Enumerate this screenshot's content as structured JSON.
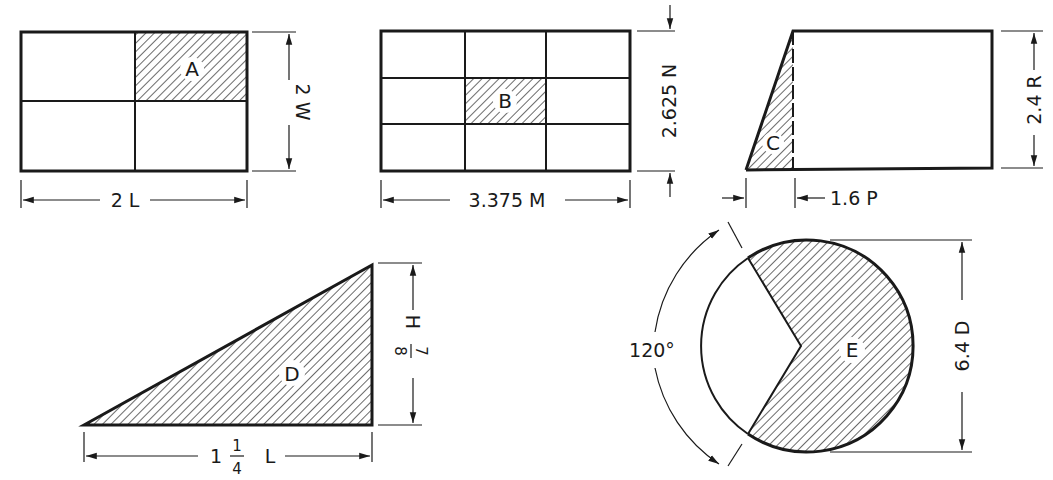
{
  "figures": {
    "A": {
      "label": "A",
      "width_dim": "2 L",
      "height_dim": "2 W",
      "grid": "2x2",
      "shaded_cell": "top-right"
    },
    "B": {
      "label": "B",
      "width_dim": "3.375 M",
      "height_dim": "2.625 N",
      "grid": "3x3",
      "shaded_cell": "center"
    },
    "C": {
      "label": "C",
      "offset_dim": "1.6 P",
      "height_dim": "2.4 R",
      "shaded_region": "left triangle"
    },
    "D": {
      "label": "D",
      "base_dim_whole": "1",
      "base_dim_num": "1",
      "base_dim_den": "4",
      "base_dim_unit": "L",
      "height_dim_num": "7",
      "height_dim_den": "8",
      "height_dim_unit": "H"
    },
    "E": {
      "label": "E",
      "angle_dim": "120°",
      "diameter_dim": "6.4 D",
      "shaded_region": "circle minus 120° sector"
    }
  },
  "colors": {
    "line": "#1a1a1a",
    "background": "#ffffff"
  }
}
